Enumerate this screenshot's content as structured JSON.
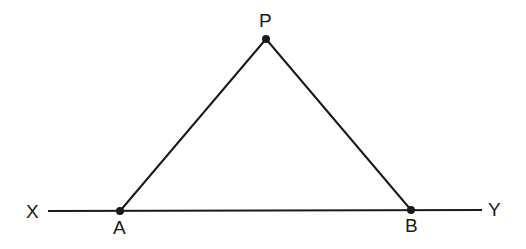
{
  "diagram": {
    "colors": {
      "stroke": "#1a1a1a",
      "background": "#ffffff"
    },
    "line": {
      "start_label": "X",
      "end_label": "Y"
    },
    "points": {
      "P": {
        "label": "P",
        "x": 266,
        "y": 39
      },
      "A": {
        "label": "A",
        "x": 120,
        "y": 211
      },
      "B": {
        "label": "B",
        "x": 411,
        "y": 210
      }
    },
    "segments": [
      "PA",
      "PB",
      "XY"
    ]
  }
}
